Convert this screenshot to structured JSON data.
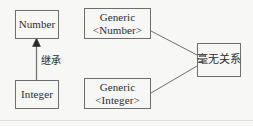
{
  "diagram": {
    "background_color": "#f7f7f5",
    "stroke_color": "#6e6e70",
    "text_color": "#2b2b2d",
    "nodes": [
      {
        "id": "number",
        "label": "Number",
        "lines": [
          "Number"
        ]
      },
      {
        "id": "integer",
        "label": "Integer",
        "lines": [
          "Integer"
        ]
      },
      {
        "id": "generic_number",
        "label": "Generic<Number>",
        "lines": [
          "Generic",
          "<Number>"
        ]
      },
      {
        "id": "generic_integer",
        "label": "Generic<Integer>",
        "lines": [
          "Generic",
          "<Integer>"
        ]
      },
      {
        "id": "unrelated",
        "label": "毫无关系",
        "lines": [
          "毫无关系"
        ]
      }
    ],
    "edges": [
      {
        "id": "inheritance",
        "from": "integer",
        "to": "number",
        "label": "继承",
        "arrow": "solid-triangle",
        "style": "solid"
      },
      {
        "id": "generic-number-to-unrelated",
        "from": "generic_number",
        "to": "unrelated",
        "label": "",
        "arrow": "none",
        "style": "solid"
      },
      {
        "id": "generic-integer-to-unrelated",
        "from": "generic_integer",
        "to": "unrelated",
        "label": "",
        "arrow": "none",
        "style": "solid"
      }
    ]
  }
}
